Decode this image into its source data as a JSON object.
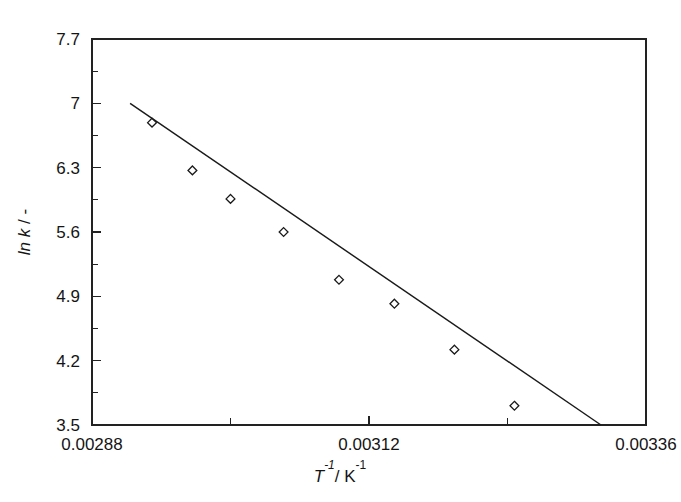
{
  "chart_data": {
    "type": "scatter",
    "title": "",
    "subtitle": "",
    "xlabel": "T-1/ K-1",
    "xlabel_parts": {
      "symbol": "T",
      "sym_exp": "-1",
      "sep": "/ ",
      "unit": "K",
      "unit_exp": "-1"
    },
    "ylabel": "ln k / -",
    "ylabel_parts": {
      "func": "ln k",
      "sep": "/ ",
      "unit": "-"
    },
    "xlim": [
      0.00288,
      0.00336
    ],
    "ylim": [
      3.5,
      7.7
    ],
    "grid": false,
    "legend": null,
    "x_ticks": [
      {
        "value": 0.00288,
        "label": "0.00288",
        "major": true
      },
      {
        "value": 0.003,
        "label": "",
        "major": false
      },
      {
        "value": 0.00312,
        "label": "0.00312",
        "major": true
      },
      {
        "value": 0.00324,
        "label": "",
        "major": false
      },
      {
        "value": 0.00336,
        "label": "0.00336",
        "major": true
      }
    ],
    "y_ticks": [
      {
        "value": 7.7,
        "label": "7.7",
        "major": true
      },
      {
        "value": 7.35,
        "label": "",
        "major": false
      },
      {
        "value": 7.0,
        "label": "7",
        "major": true
      },
      {
        "value": 6.65,
        "label": "",
        "major": false
      },
      {
        "value": 6.3,
        "label": "6.3",
        "major": true
      },
      {
        "value": 5.95,
        "label": "",
        "major": false
      },
      {
        "value": 5.6,
        "label": "5.6",
        "major": true
      },
      {
        "value": 5.25,
        "label": "",
        "major": false
      },
      {
        "value": 4.9,
        "label": "4.9",
        "major": true
      },
      {
        "value": 4.55,
        "label": "",
        "major": false
      },
      {
        "value": 4.2,
        "label": "4.2",
        "major": true
      },
      {
        "value": 3.85,
        "label": "",
        "major": false
      },
      {
        "value": 3.5,
        "label": "3.5",
        "major": true
      }
    ],
    "series": [
      {
        "name": "data",
        "marker": "open-diamond",
        "x": [
          0.002932,
          0.002967,
          0.003,
          0.003046,
          0.003094,
          0.003142,
          0.003194,
          0.003246
        ],
        "y": [
          6.79,
          6.27,
          5.96,
          5.6,
          5.08,
          4.82,
          4.32,
          3.71
        ]
      },
      {
        "name": "fit-line",
        "marker": "none",
        "x": [
          0.002913,
          0.003321
        ],
        "y": [
          7.0,
          3.5
        ]
      }
    ]
  },
  "colors": {
    "axis": "#222222",
    "text": "#141414",
    "line": "#1a1a1a",
    "marker": "#1a1a1a",
    "background": "#ffffff"
  }
}
